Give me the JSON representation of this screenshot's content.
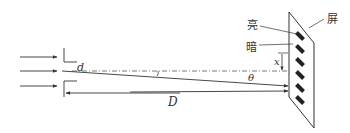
{
  "diagram": {
    "type": "double-slit interference",
    "labels": {
      "slit_separation": "d",
      "screen_distance": "D",
      "angle": "θ",
      "fringe_position": "x",
      "bright": "亮",
      "dark": "暗",
      "screen": "屏"
    },
    "incident_rays": 3,
    "fringes_on_screen": 6,
    "colors": {
      "line": "#333333",
      "fringe": "#222222",
      "background": "#ffffff"
    }
  }
}
